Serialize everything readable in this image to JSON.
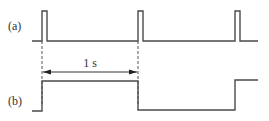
{
  "labels": {
    "a": "(a)",
    "b": "(b)",
    "period": "1 s"
  },
  "signals": {
    "a": {
      "description": "short periodic pulses",
      "pulse_count": 3
    },
    "b": {
      "description": "square wave toggling on each pulse"
    }
  },
  "colors": {
    "line": "#4a4a4a",
    "background": "#ffffff"
  }
}
